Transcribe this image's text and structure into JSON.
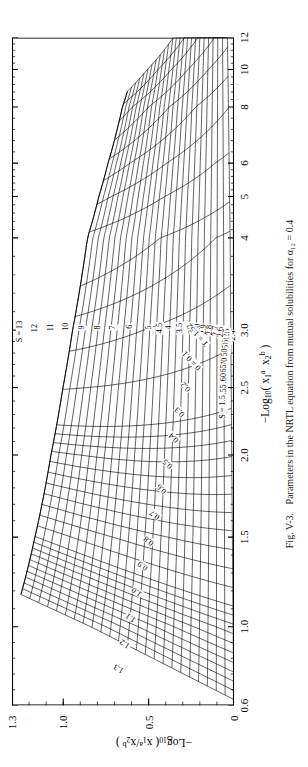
{
  "figure": {
    "caption_number": "Fig. V-3.",
    "caption_text": "Parameters in the NRTL equation from mutual solubilities for α₁₂ = 0.4",
    "rotation_deg": -90,
    "ink_color": "#000000",
    "background_color": "#ffffff"
  },
  "chart_data": {
    "type": "line",
    "title": "Parameters in the NRTL equation from mutual solubilities for α₁₂ = 0.4",
    "xlabel": "-Log10 ( x1a x2b )",
    "ylabel": "-Log10 ( x1a / x2b )",
    "xlabel_parts": {
      "prefix": "−Log",
      "base": "10",
      "open": "( x",
      "s1": "1",
      "e1": "a",
      "mid": "  x",
      "s2": "2",
      "e2": "b",
      "close": " )"
    },
    "ylabel_parts": {
      "prefix": "−Log",
      "base": "10",
      "open": "( x",
      "s1": "1",
      "e1": "a",
      "mid": " / x",
      "s2": "2",
      "e2": "b",
      "close": " )"
    },
    "xscale": "log-like-nonuniform",
    "xlim": [
      0.6,
      12
    ],
    "ylim": [
      0,
      1.3
    ],
    "grid": false,
    "legend": "none",
    "xticks": [
      0.6,
      1.0,
      1.5,
      2.0,
      2.5,
      3.0,
      4,
      5,
      6,
      8,
      10,
      12
    ],
    "xticklabels": [
      "0.6",
      "1.0",
      "1.5",
      "2.0",
      "2.5",
      "3.0",
      "4",
      "5",
      "6",
      "8",
      "10",
      "12"
    ],
    "xtick_positions_frac": [
      0.0,
      0.118,
      0.252,
      0.375,
      0.476,
      0.562,
      0.7,
      0.762,
      0.812,
      0.896,
      0.952,
      1.0
    ],
    "yticks": [
      0,
      0.5,
      1.0,
      1.3
    ],
    "yticklabels": [
      "0",
      "0.5",
      "1.0",
      "1.3"
    ],
    "ytick_positions_frac": [
      0.0,
      0.3846,
      0.7692,
      1.0
    ],
    "families": [
      {
        "name": "S",
        "label_prefix": "S = ",
        "first_label": "S = 13",
        "values": [
          13,
          12,
          11,
          10,
          9,
          8,
          7,
          6,
          5,
          4.5,
          4,
          3.5,
          3.1,
          3.0,
          2.9,
          2.8,
          2.7,
          2.6,
          2.5,
          2.4,
          2.3,
          2.2,
          2.1,
          2.0,
          1.95,
          1.9,
          1.85,
          1.8,
          1.75,
          1.7,
          1.65,
          1.6,
          1.55,
          1.5
        ],
        "last_label": "S = 1.5"
      },
      {
        "name": "T",
        "label_prefix": "T = ",
        "values": [
          1.3,
          1.2,
          1.1,
          1.0,
          0.9,
          0.8,
          0.7,
          0.6,
          0.5,
          0.4,
          0.3,
          0.2,
          0.1
        ],
        "zero_label": "0 = 0.1",
        "last_label": "T = 1.52"
      }
    ]
  },
  "labels": {
    "s_curves": [
      {
        "text": "S = 13",
        "x": 0.56,
        "y": 0.965
      },
      {
        "text": "12",
        "x": 0.565,
        "y": 0.895
      },
      {
        "text": "11",
        "x": 0.566,
        "y": 0.826
      },
      {
        "text": "10",
        "x": 0.567,
        "y": 0.757
      },
      {
        "text": "9",
        "x": 0.566,
        "y": 0.686
      },
      {
        "text": "8",
        "x": 0.566,
        "y": 0.614
      },
      {
        "text": "7",
        "x": 0.566,
        "y": 0.543
      },
      {
        "text": "6",
        "x": 0.567,
        "y": 0.47
      },
      {
        "text": "5",
        "x": 0.566,
        "y": 0.385
      },
      {
        "text": "4.5",
        "x": 0.565,
        "y": 0.335
      },
      {
        "text": "4",
        "x": 0.566,
        "y": 0.291
      },
      {
        "text": "3.5",
        "x": 0.565,
        "y": 0.245
      },
      {
        "text": "3.1",
        "x": 0.564,
        "y": 0.19
      },
      {
        "text": "3.0",
        "x": 0.564,
        "y": 0.163
      },
      {
        "text": "2.9",
        "x": 0.563,
        "y": 0.136
      },
      {
        "text": "2.8",
        "x": 0.562,
        "y": 0.11
      },
      {
        "text": "2.7",
        "x": 0.561,
        "y": 0.083
      },
      {
        "text": "2.6",
        "x": 0.559,
        "y": 0.057
      },
      {
        "text": "2.5",
        "x": 0.557,
        "y": 0.031
      },
      {
        "text": "2.4",
        "x": 0.554,
        "y": 0.006
      }
    ],
    "s_curves_low": [
      {
        "text": "2.3",
        "x": 0.552,
        "y": 0.0
      },
      {
        "text": "2.2",
        "x": 0.549,
        "y": 0.0
      },
      {
        "text": "2.1",
        "x": 0.545,
        "y": 0.0
      },
      {
        "text": "2.0",
        "x": 0.54,
        "y": 0.0
      },
      {
        "text": "1.95",
        "x": 0.537,
        "y": 0.0
      },
      {
        "text": "1.90",
        "x": 0.533,
        "y": 0.0
      },
      {
        "text": "1.85",
        "x": 0.529,
        "y": 0.0
      },
      {
        "text": "1.80",
        "x": 0.524,
        "y": 0.0
      },
      {
        "text": "1.75",
        "x": 0.518,
        "y": 0.0
      },
      {
        "text": "1.70",
        "x": 0.51,
        "y": 0.0
      },
      {
        "text": "1.65",
        "x": 0.5,
        "y": 0.0
      },
      {
        "text": "1.60",
        "x": 0.487,
        "y": 0.0
      },
      {
        "text": "1.55",
        "x": 0.47,
        "y": 0.0
      },
      {
        "text": "S = 1.5",
        "x": 0.447,
        "y": 0.0
      }
    ],
    "t_curves": [
      {
        "text": "1.3",
        "x": 0.0,
        "y": 0.0
      },
      {
        "text": "1.2",
        "x": 0.0,
        "y": 0.0
      },
      {
        "text": "1.1",
        "x": 0.0,
        "y": 0.0
      },
      {
        "text": "1.0",
        "x": 0.0,
        "y": 0.0
      },
      {
        "text": "0.9",
        "x": 0.0,
        "y": 0.0
      },
      {
        "text": "0.8",
        "x": 0.0,
        "y": 0.0
      },
      {
        "text": "0.7",
        "x": 0.0,
        "y": 0.0
      },
      {
        "text": "0.6",
        "x": 0.0,
        "y": 0.0
      },
      {
        "text": "0.5",
        "x": 0.0,
        "y": 0.0
      },
      {
        "text": "0.4",
        "x": 0.0,
        "y": 0.0
      },
      {
        "text": "0.3",
        "x": 0.0,
        "y": 0.0
      },
      {
        "text": "0.2",
        "x": 0.0,
        "y": 0.0
      },
      {
        "text": "0 = 0.1",
        "x": 0.0,
        "y": 0.0
      },
      {
        "text": "T = 1.52",
        "x": 0.0,
        "y": 0.0
      }
    ]
  }
}
